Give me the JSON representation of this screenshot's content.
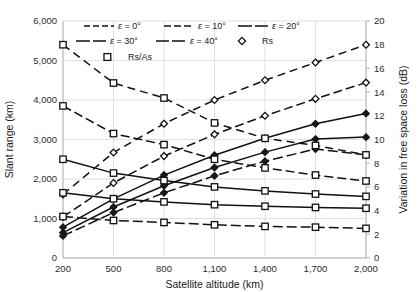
{
  "chart_data": {
    "type": "line",
    "title": "",
    "xlabel": "Satellite altitude (km)",
    "ylabel": "Slant range (km)",
    "y2label": "Variation in free space loss (dB)",
    "xlim": [
      200,
      2000
    ],
    "ylim": [
      0,
      6000
    ],
    "y2lim": [
      0,
      20
    ],
    "grid": true,
    "legend_position": "top-center-inside",
    "x_ticks": [
      "200",
      "500",
      "800",
      "1,100",
      "1,400",
      "1,700",
      "2,000"
    ],
    "x_tick_values": [
      200,
      500,
      800,
      1100,
      1400,
      1700,
      2000
    ],
    "y_ticks": [
      "0",
      "1,000",
      "2,000",
      "3,000",
      "4,000",
      "5,000",
      "6,000"
    ],
    "y_tick_values": [
      0,
      1000,
      2000,
      3000,
      4000,
      5000,
      6000
    ],
    "y2_ticks": [
      "0",
      "2",
      "4",
      "6",
      "8",
      "10",
      "12",
      "14",
      "16",
      "18",
      "20"
    ],
    "y2_tick_values": [
      0,
      2,
      4,
      6,
      8,
      10,
      12,
      14,
      16,
      18,
      20
    ],
    "x": [
      200,
      500,
      800,
      1100,
      1400,
      1700,
      2000
    ],
    "series": [
      {
        "name": "Rs, ε = 0°",
        "group": "Rs",
        "elevation_deg": 0,
        "axis": "left",
        "marker": "diamond",
        "dash": "8,5",
        "values": [
          1610,
          2670,
          3400,
          4000,
          4500,
          4950,
          5400
        ],
        "values_db": [
          5.4,
          8.9,
          11.3,
          13.3,
          15.0,
          16.5,
          18.0
        ]
      },
      {
        "name": "Rs, ε = 10°",
        "group": "Rs",
        "elevation_deg": 10,
        "axis": "left",
        "marker": "diamond",
        "dash": "9,4",
        "values": [
          1040,
          1900,
          2580,
          3130,
          3600,
          4030,
          4440
        ],
        "values_db": [
          3.5,
          6.3,
          8.6,
          10.4,
          12.0,
          13.4,
          14.8
        ]
      },
      {
        "name": "Rs, ε = 20°",
        "group": "Rs",
        "elevation_deg": 20,
        "axis": "left",
        "marker": "diamond",
        "dash": "none",
        "values": [
          780,
          1500,
          2100,
          2600,
          3030,
          3400,
          3660
        ],
        "values_db": [
          2.6,
          5.0,
          7.0,
          8.7,
          10.1,
          11.3,
          12.2
        ]
      },
      {
        "name": "Rs, ε = 30°",
        "group": "Rs",
        "elevation_deg": 30,
        "axis": "left",
        "marker": "diamond",
        "dash": "none",
        "values": [
          640,
          1290,
          1830,
          2290,
          2680,
          3010,
          3060
        ],
        "values_db": [
          2.1,
          4.3,
          6.1,
          7.6,
          8.9,
          10.0,
          10.2
        ]
      },
      {
        "name": "Rs, ε = 40°",
        "group": "Rs",
        "elevation_deg": 40,
        "axis": "left",
        "marker": "diamond",
        "dash": "10,4",
        "values": [
          560,
          1150,
          1650,
          2080,
          2450,
          2760,
          2610
        ],
        "values_db": [
          1.9,
          3.8,
          5.5,
          6.9,
          8.2,
          9.2,
          8.7
        ]
      },
      {
        "name": "Rs/As, ε = 0°",
        "group": "Rs/As",
        "elevation_deg": 0,
        "axis": "left",
        "marker": "square",
        "dash": "8,5",
        "values": [
          5400,
          4430,
          4050,
          3420,
          3030,
          2850,
          2610
        ],
        "values_db": [
          18.0,
          14.8,
          13.5,
          11.4,
          10.1,
          9.5,
          8.7
        ]
      },
      {
        "name": "Rs/As, ε = 10°",
        "group": "Rs/As",
        "elevation_deg": 10,
        "axis": "left",
        "marker": "square",
        "dash": "9,4",
        "values": [
          3850,
          3150,
          2870,
          2500,
          2280,
          2100,
          1950
        ],
        "values_db": [
          12.8,
          10.5,
          9.6,
          8.3,
          7.6,
          7.0,
          6.5
        ]
      },
      {
        "name": "Rs/As, ε = 20°",
        "group": "Rs/As",
        "elevation_deg": 20,
        "axis": "left",
        "marker": "square",
        "dash": "none",
        "values": [
          2500,
          2150,
          1960,
          1800,
          1700,
          1620,
          1560
        ],
        "values_db": [
          8.3,
          7.2,
          6.5,
          6.0,
          5.7,
          5.4,
          5.2
        ]
      },
      {
        "name": "Rs/As, ε = 30°",
        "group": "Rs/As",
        "elevation_deg": 30,
        "axis": "left",
        "marker": "square",
        "dash": "none",
        "values": [
          1650,
          1500,
          1420,
          1350,
          1310,
          1280,
          1260
        ],
        "values_db": [
          5.5,
          5.0,
          4.7,
          4.5,
          4.4,
          4.3,
          4.2
        ]
      },
      {
        "name": "Rs/As, ε = 40°",
        "group": "Rs/As",
        "elevation_deg": 40,
        "axis": "left",
        "marker": "square",
        "dash": "10,4",
        "values": [
          1050,
          950,
          900,
          840,
          800,
          780,
          750
        ],
        "values_db": [
          3.5,
          3.2,
          3.0,
          2.8,
          2.7,
          2.6,
          2.5
        ]
      }
    ]
  },
  "legend": {
    "rows": [
      [
        {
          "label": "ε = 0°",
          "eps": "ε",
          "rest": " = 0°",
          "kind": "line",
          "dash": "6,3"
        },
        {
          "label": "ε = 10°",
          "eps": "ε",
          "rest": " = 10°",
          "kind": "line",
          "dash": "7,3"
        },
        {
          "label": "ε = 20°",
          "eps": "ε",
          "rest": " = 20°",
          "kind": "line",
          "dash": "14,3"
        }
      ],
      [
        {
          "label": "ε = 30°",
          "eps": "ε",
          "rest": " = 30°",
          "kind": "line",
          "dash": "14,3"
        },
        {
          "label": "ε = 40°",
          "eps": "ε",
          "rest": " = 40°",
          "kind": "line",
          "dash": "13,3"
        },
        {
          "label": "Rs",
          "kind": "diamond"
        }
      ],
      [
        {
          "label": "Rs/As",
          "kind": "square"
        }
      ]
    ]
  },
  "colors": {
    "ink": "#111111",
    "grid": "#d9d9d9",
    "frame": "#b5b5b5",
    "background": "#ffffff"
  }
}
